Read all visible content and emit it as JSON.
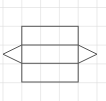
{
  "diagram": {
    "type": "net-of-triangular-prism",
    "background": "#ffffff",
    "grid": {
      "color": "#dcdcdc",
      "cell_size": 18.8,
      "origin_x": 3,
      "origin_y": 7.5,
      "columns": 5,
      "rows": 5
    },
    "shape": {
      "stroke": "#555555",
      "stroke_width": 1,
      "rectangle": {
        "x1": 21.8,
        "y1": 26.3,
        "x2": 78.2,
        "y2": 82
      },
      "inner_lines_y": [
        45,
        63.3
      ],
      "left_triangle": [
        [
          21.8,
          45
        ],
        [
          3,
          54.2
        ],
        [
          21.8,
          63.3
        ]
      ],
      "right_triangle": [
        [
          78.2,
          45
        ],
        [
          97,
          54.2
        ],
        [
          78.2,
          63.3
        ]
      ]
    }
  }
}
